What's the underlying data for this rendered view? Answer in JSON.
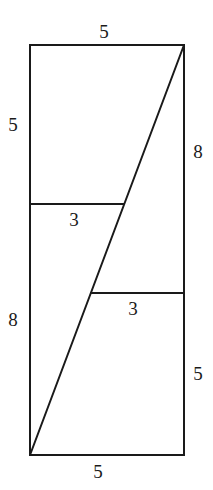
{
  "figure": {
    "rectangle": {
      "width": 5,
      "height": 13
    },
    "labels": {
      "top_width": "5",
      "left_upper": "5",
      "left_lower": "8",
      "right_upper": "8",
      "right_lower": "5",
      "bottom_width": "5",
      "upper_cut": "3",
      "lower_cut": "3"
    },
    "segments": {
      "left_split_from_top": 5,
      "right_split_from_bottom": 5,
      "upper_cut_length": 3,
      "lower_cut_length": 3
    },
    "colors": {
      "line": "#1a1a1a",
      "background": "#ffffff"
    }
  }
}
